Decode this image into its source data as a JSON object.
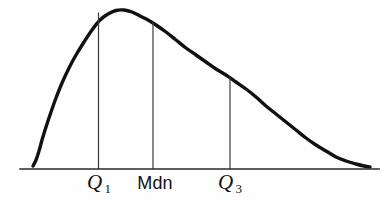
{
  "figure": {
    "kind": "frequency-distribution-curve",
    "background_color": "#fefefe",
    "ink_color": "#111111",
    "curve_color": "#111111",
    "baseline_color": "#2a2a2a",
    "ordinate_color": "#3a3a3a",
    "curve_stroke_width": 3.4,
    "baseline_stroke_width": 1.6,
    "ordinate_stroke_width": 1.2
  },
  "axis": {
    "baseline": {
      "x_start": 20,
      "x_end": 379,
      "y": 169
    }
  },
  "labels": [
    {
      "id": "q1",
      "text": "Q",
      "subscript": "1",
      "style": "serif-italic",
      "x": 99
    },
    {
      "id": "mdn",
      "text": "Mdn",
      "subscript": "",
      "style": "sans",
      "x": 155
    },
    {
      "id": "q3",
      "text": "Q",
      "subscript": "3",
      "style": "serif-italic",
      "x": 230
    }
  ],
  "ordinates": [
    {
      "id": "q1",
      "x": 98.5,
      "y_top": 12.5,
      "y_bottom": 169
    },
    {
      "id": "mdn",
      "x": 153,
      "y_top": 22.0,
      "y_bottom": 169
    },
    {
      "id": "q3",
      "x": 230,
      "y_top": 76.5,
      "y_bottom": 169
    }
  ],
  "chart_data": {
    "type": "line",
    "title": "",
    "xlabel": "",
    "ylabel": "",
    "grid": false,
    "legend": null,
    "xlim": [
      20,
      379
    ],
    "ylim": [
      169,
      8
    ],
    "annotations": [
      "Q 1",
      "Mdn",
      "Q 3"
    ],
    "series": [
      {
        "name": "frequency-curve",
        "points": [
          [
            33,
            166
          ],
          [
            36,
            160
          ],
          [
            39,
            151
          ],
          [
            42,
            140
          ],
          [
            46,
            127
          ],
          [
            51,
            112
          ],
          [
            56,
            98
          ],
          [
            62,
            83
          ],
          [
            69,
            68
          ],
          [
            76,
            55
          ],
          [
            84,
            42
          ],
          [
            92,
            30
          ],
          [
            100,
            20
          ],
          [
            108,
            14
          ],
          [
            116,
            10.5
          ],
          [
            124,
            10
          ],
          [
            132,
            12
          ],
          [
            140,
            16
          ],
          [
            148,
            20
          ],
          [
            156,
            25
          ],
          [
            166,
            32
          ],
          [
            176,
            40
          ],
          [
            186,
            48
          ],
          [
            196,
            55
          ],
          [
            206,
            62
          ],
          [
            216,
            69
          ],
          [
            226,
            75
          ],
          [
            236,
            82
          ],
          [
            246,
            89
          ],
          [
            256,
            97
          ],
          [
            266,
            106
          ],
          [
            276,
            114
          ],
          [
            286,
            122
          ],
          [
            296,
            130
          ],
          [
            306,
            138
          ],
          [
            316,
            145
          ],
          [
            326,
            151
          ],
          [
            336,
            157
          ],
          [
            346,
            161
          ],
          [
            356,
            164
          ],
          [
            364,
            166
          ],
          [
            370,
            167
          ]
        ]
      }
    ],
    "markers": [
      {
        "label": "Q 1",
        "x": 98.5,
        "curve_y": 12.5
      },
      {
        "label": "Mdn",
        "x": 153,
        "curve_y": 22.0
      },
      {
        "label": "Q 3",
        "x": 230,
        "curve_y": 76.5
      }
    ]
  }
}
